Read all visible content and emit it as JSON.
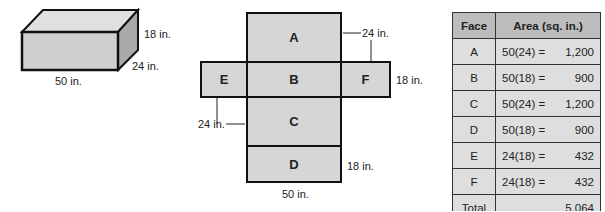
{
  "box": {
    "dim_height": "18 in.",
    "dim_depth": "24 in.",
    "dim_length": "50 in.",
    "fill_color": "#cfcfcf"
  },
  "net": {
    "faces": [
      "A",
      "B",
      "C",
      "D",
      "E",
      "F"
    ],
    "label_24_top": "24 in.",
    "label_18_right": "18 in.",
    "label_24_left": "24 in.",
    "label_18_bottom": "18 in.",
    "label_50_bottom": "50 in."
  },
  "table": {
    "headers": [
      "Face",
      "Area (sq. in.)"
    ],
    "rows": [
      {
        "face": "A",
        "expr": "50(24) =",
        "value": "1,200"
      },
      {
        "face": "B",
        "expr": "50(18) =",
        "value": "900"
      },
      {
        "face": "C",
        "expr": "50(24) =",
        "value": "1,200"
      },
      {
        "face": "D",
        "expr": "50(18) =",
        "value": "900"
      },
      {
        "face": "E",
        "expr": "24(18) =",
        "value": "432"
      },
      {
        "face": "F",
        "expr": "24(18) =",
        "value": "432"
      }
    ],
    "total_label": "Total",
    "total_value": "5,064"
  }
}
